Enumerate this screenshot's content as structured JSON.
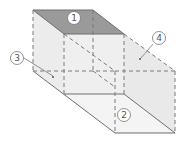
{
  "diagram": {
    "colors": {
      "top_face": "#9a9a9a",
      "side_face": "#ececec",
      "light_face": "#f2f2f2",
      "edge": "#777777",
      "label_stroke": "#777777"
    },
    "labels": [
      {
        "id": "1",
        "text": "1",
        "cx": 74,
        "cy": 18
      },
      {
        "id": "2",
        "text": "2",
        "cx": 124,
        "cy": 115
      },
      {
        "id": "3",
        "text": "3",
        "cx": 17,
        "cy": 58
      },
      {
        "id": "4",
        "text": "4",
        "cx": 159,
        "cy": 38
      }
    ]
  }
}
